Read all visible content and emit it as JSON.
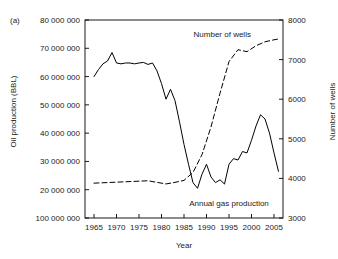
{
  "panel": {
    "label": "(a)"
  },
  "axes": {
    "x": {
      "title": "Year",
      "ticks": [
        1965,
        1970,
        1975,
        1980,
        1985,
        1990,
        1995,
        2000,
        2005
      ],
      "tick_labels": [
        "1965",
        "1970",
        "1975",
        "1980",
        "1985",
        "1990",
        "1995",
        "2000",
        "2005"
      ],
      "range": [
        1963,
        2007
      ]
    },
    "y_left": {
      "title": "Oil production (BBL)",
      "ticks": [
        10000000,
        20000000,
        30000000,
        40000000,
        50000000,
        60000000,
        70000000,
        80000000
      ],
      "tick_labels": [
        "100 000 000",
        "20 000 000",
        "30 000 000",
        "40 000 000",
        "50 000 000",
        "60 000 000",
        "70 000 000",
        "80 000 000"
      ],
      "range": [
        10000000,
        80000000
      ]
    },
    "y_right": {
      "title": "Number of wells",
      "ticks": [
        3000,
        4000,
        5000,
        6000,
        7000,
        8000
      ],
      "tick_labels": [
        "3000",
        "4000",
        "5000",
        "6000",
        "7000",
        "8000"
      ],
      "range": [
        3000,
        8000
      ]
    }
  },
  "annotations": [
    {
      "name": "wells-annotation",
      "text": "Number of wells",
      "x": 1993.5,
      "y_frac": 0.93
    },
    {
      "name": "gas-annotation",
      "text": "Annual gas production",
      "x": 1995.0,
      "y_frac": 0.075
    }
  ],
  "chart_data": {
    "type": "line",
    "title": "",
    "xlabel": "Year",
    "ylabel": "Oil production (BBL)",
    "ylabel_secondary": "Number of wells",
    "xlim": [
      1963,
      2007
    ],
    "ylim": [
      10000000,
      80000000
    ],
    "ylim_secondary": [
      3000,
      8000
    ],
    "grid": false,
    "legend": "inline-annotations",
    "series": [
      {
        "name": "Annual gas production",
        "axis": "left",
        "style": "solid",
        "color": "#000000",
        "x": [
          1965,
          1966,
          1967,
          1968,
          1969,
          1970,
          1971,
          1972,
          1973,
          1974,
          1975,
          1976,
          1977,
          1978,
          1979,
          1980,
          1981,
          1982,
          1983,
          1984,
          1985,
          1986,
          1987,
          1988,
          1989,
          1990,
          1991,
          1992,
          1993,
          1994,
          1995,
          1996,
          1997,
          1998,
          1999,
          2000,
          2001,
          2002,
          2003,
          2004,
          2005,
          2006
        ],
        "y": [
          60000000,
          62500000,
          64500000,
          65500000,
          68500000,
          64800000,
          64500000,
          64800000,
          64800000,
          64500000,
          64800000,
          65000000,
          64300000,
          64800000,
          62000000,
          57500000,
          52000000,
          55500000,
          51500000,
          44000000,
          36000000,
          29000000,
          22500000,
          20500000,
          25500000,
          29000000,
          24500000,
          22500000,
          23500000,
          22000000,
          29000000,
          31000000,
          30500000,
          33500000,
          33000000,
          37500000,
          42500000,
          46500000,
          45000000,
          40000000,
          33000000,
          26500000
        ]
      },
      {
        "name": "Number of wells",
        "axis": "right",
        "style": "dashed",
        "color": "#000000",
        "x": [
          1965,
          1967,
          1969,
          1971,
          1973,
          1975,
          1977,
          1979,
          1981,
          1983,
          1985,
          1987,
          1989,
          1991,
          1993,
          1995,
          1997,
          1999,
          2001,
          2003,
          2005,
          2006
        ],
        "y": [
          3880,
          3890,
          3900,
          3910,
          3920,
          3930,
          3940,
          3900,
          3860,
          3900,
          3950,
          4150,
          4600,
          5300,
          6150,
          6950,
          7250,
          7200,
          7350,
          7450,
          7500,
          7520
        ]
      }
    ]
  }
}
